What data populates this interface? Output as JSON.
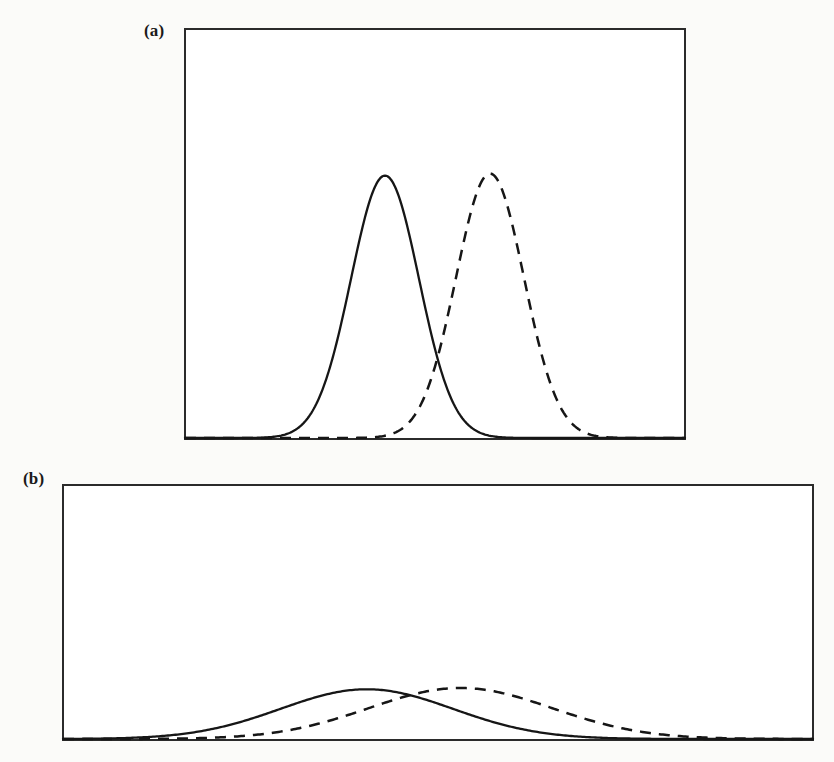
{
  "figure": {
    "background_color": "#fbfbf9",
    "ink_color": "#161616",
    "frame_color": "#2b2b2b",
    "panel_fill": "#ffffff"
  },
  "panels": [
    {
      "id": "a",
      "label": "(a)",
      "frame": {
        "x": 5,
        "y": 5,
        "width": 500,
        "height": 410
      }
    },
    {
      "id": "b",
      "label": "(b)",
      "frame": {
        "x": 5,
        "y": 5,
        "width": 750,
        "height": 255
      }
    }
  ],
  "chart_data": [
    {
      "type": "line",
      "title": "(a)",
      "xlabel": "",
      "ylabel": "",
      "grid": false,
      "legend": null,
      "xlim": [
        0,
        1
      ],
      "ylim": [
        0,
        1
      ],
      "description": "Two narrow well-separated Gaussian curves; solid curve on the left, dashed curve on the right, overlapping only in the tails.",
      "series": [
        {
          "name": "solid-curve",
          "style": "solid",
          "distribution": "gaussian",
          "mean": 0.4,
          "sigma": 0.068,
          "peak_height": 0.64,
          "x": [
            0.0,
            0.05,
            0.1,
            0.15,
            0.2,
            0.25,
            0.28,
            0.3,
            0.32,
            0.34,
            0.36,
            0.38,
            0.4,
            0.42,
            0.44,
            0.46,
            0.48,
            0.5,
            0.52,
            0.55,
            0.6,
            0.65,
            0.7,
            0.8,
            0.9,
            1.0
          ],
          "values": [
            0.0,
            0.0,
            0.0,
            0.001,
            0.005,
            0.025,
            0.06,
            0.11,
            0.19,
            0.3,
            0.43,
            0.56,
            0.64,
            0.61,
            0.5,
            0.37,
            0.25,
            0.15,
            0.08,
            0.03,
            0.006,
            0.001,
            0.0,
            0.0,
            0.0,
            0.0
          ]
        },
        {
          "name": "dashed-curve",
          "style": "dashed",
          "distribution": "gaussian",
          "mean": 0.61,
          "sigma": 0.068,
          "peak_height": 0.645,
          "x": [
            0.0,
            0.1,
            0.2,
            0.3,
            0.36,
            0.4,
            0.44,
            0.48,
            0.51,
            0.53,
            0.55,
            0.57,
            0.59,
            0.61,
            0.63,
            0.65,
            0.67,
            0.69,
            0.72,
            0.76,
            0.82,
            0.88,
            0.95,
            1.0
          ],
          "values": [
            0.0,
            0.0,
            0.0,
            0.002,
            0.01,
            0.03,
            0.075,
            0.16,
            0.26,
            0.35,
            0.46,
            0.56,
            0.625,
            0.645,
            0.62,
            0.54,
            0.43,
            0.31,
            0.17,
            0.06,
            0.01,
            0.002,
            0.0,
            0.0
          ]
        }
      ],
      "annotations": [
        {
          "name": "crossing-point",
          "x": 0.505,
          "y": 0.148
        }
      ]
    },
    {
      "type": "line",
      "title": "(b)",
      "xlabel": "",
      "ylabel": "",
      "grid": false,
      "legend": null,
      "xlim": [
        0,
        1
      ],
      "ylim": [
        0,
        1
      ],
      "description": "Two broad low-amplitude Gaussian curves drawn on a wide, short axis; solid curve peaks slightly left of the dashed curve and the two heavily overlap.",
      "series": [
        {
          "name": "solid-curve",
          "style": "solid",
          "distribution": "gaussian",
          "mean": 0.405,
          "sigma": 0.115,
          "peak_height": 0.195,
          "x": [
            0.0,
            0.05,
            0.1,
            0.13,
            0.16,
            0.2,
            0.24,
            0.28,
            0.32,
            0.36,
            0.4,
            0.44,
            0.48,
            0.52,
            0.56,
            0.6,
            0.65,
            0.7,
            0.75,
            0.8,
            0.85,
            0.9,
            1.0
          ],
          "values": [
            0.0,
            0.002,
            0.008,
            0.015,
            0.026,
            0.048,
            0.08,
            0.118,
            0.157,
            0.184,
            0.195,
            0.186,
            0.16,
            0.126,
            0.09,
            0.058,
            0.028,
            0.011,
            0.004,
            0.001,
            0.0,
            0.0,
            0.0
          ]
        },
        {
          "name": "dashed-curve",
          "style": "dashed",
          "distribution": "gaussian",
          "mean": 0.53,
          "sigma": 0.122,
          "peak_height": 0.2,
          "x": [
            0.0,
            0.05,
            0.1,
            0.15,
            0.2,
            0.25,
            0.3,
            0.34,
            0.38,
            0.42,
            0.46,
            0.5,
            0.53,
            0.56,
            0.6,
            0.64,
            0.68,
            0.72,
            0.76,
            0.8,
            0.85,
            0.92,
            1.0
          ],
          "values": [
            0.0,
            0.0,
            0.003,
            0.008,
            0.018,
            0.035,
            0.062,
            0.09,
            0.122,
            0.153,
            0.18,
            0.197,
            0.2,
            0.195,
            0.175,
            0.142,
            0.104,
            0.068,
            0.04,
            0.021,
            0.008,
            0.001,
            0.0
          ]
        }
      ],
      "annotations": [
        {
          "name": "crossing-point",
          "x": 0.458,
          "y": 0.176
        }
      ]
    }
  ]
}
